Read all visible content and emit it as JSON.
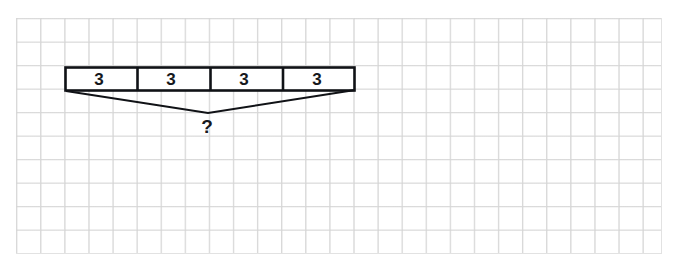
{
  "diagram": {
    "kind": "part-whole-bar-model",
    "background": "graph-paper-grid",
    "grid": {
      "line_color": "#dadada",
      "cell_size_px": 24,
      "columns": 27,
      "rows": 10
    },
    "bar": {
      "stroke_color": "#101216",
      "fill_color": "#ffffff",
      "segment_count": 4,
      "segments": [
        {
          "label": "3"
        },
        {
          "label": "3"
        },
        {
          "label": "3"
        },
        {
          "label": "3"
        }
      ]
    },
    "brace": {
      "stroke_color": "#101216",
      "total_label": "?"
    }
  }
}
